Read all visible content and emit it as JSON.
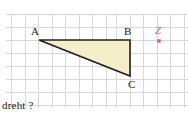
{
  "figure": {
    "type": "geometry-diagram",
    "background_color": "#ffffff",
    "grid": {
      "visible": true,
      "line_color": "#d5d5d8",
      "spacing_px": 13.5,
      "origin_x": 11,
      "origin_y": 14,
      "columns": 13,
      "rows": 7,
      "left": 11,
      "top": 14,
      "right": 186,
      "bottom": 108
    },
    "shape": {
      "name": "triangle-abc",
      "fill_color": "#f6eecb",
      "stroke_color": "#231f1c",
      "stroke_width": 1.6,
      "vertices": [
        {
          "label": "A",
          "x": 39,
          "y": 40
        },
        {
          "label": "B",
          "x": 130,
          "y": 40
        },
        {
          "label": "C",
          "x": 130,
          "y": 76
        }
      ]
    },
    "vertex_labels": [
      {
        "label": "A",
        "x": 31,
        "y": 27,
        "color": "#1a1a1a"
      },
      {
        "label": "B",
        "x": 125,
        "y": 27,
        "color": "#1a1a1a"
      },
      {
        "label": "C",
        "x": 129,
        "y": 78,
        "color": "#1a1a1a"
      }
    ],
    "points": [
      {
        "label": "Z",
        "x": 159,
        "y": 41,
        "color": "#e0588f",
        "marker": "square",
        "label_x": 157,
        "label_y": 27
      }
    ]
  },
  "caption": {
    "text": "dreht ?"
  }
}
